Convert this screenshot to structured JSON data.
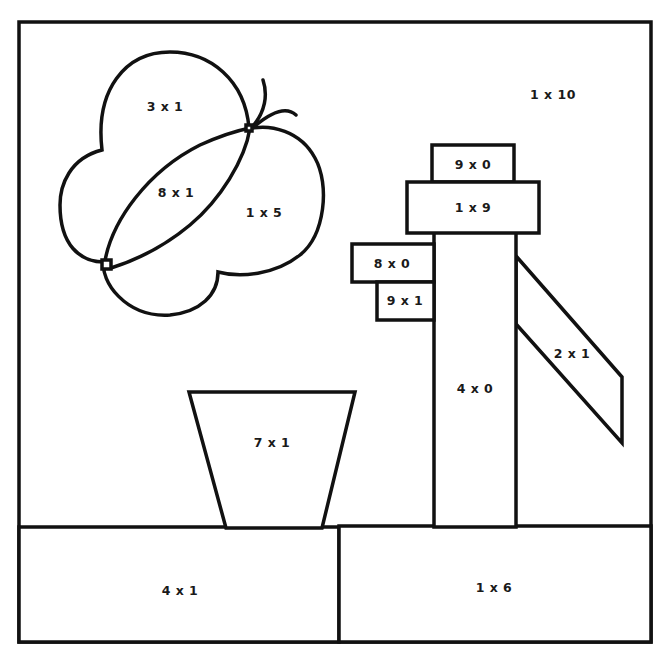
{
  "page": {
    "type": "color-by-multiplication worksheet",
    "line_color": "#111111",
    "background": "#ffffff"
  },
  "regions": {
    "sky": "1 x 10",
    "butterfly_upper_wing": "3 x 1",
    "butterfly_body": "8 x 1",
    "butterfly_lower_wing": "1 x 5",
    "pump_cap_top": "9 x 0",
    "pump_cap_bottom": "1 x 9",
    "pump_spout_upper": "8 x 0",
    "pump_spout_lower": "9 x 1",
    "pump_body": "4 x 0",
    "pump_handle": "2 x 1",
    "flower_pot": "7 x 1",
    "ground_left": "4 x 1",
    "ground_right": "1 x 6"
  }
}
